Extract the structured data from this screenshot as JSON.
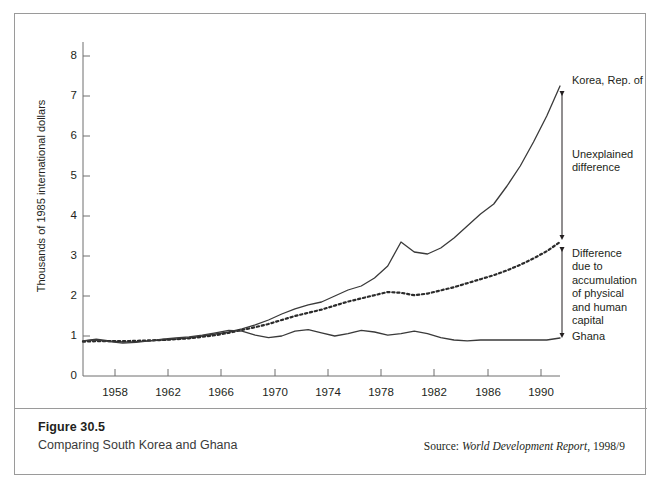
{
  "figure": {
    "number": "Figure 30.5",
    "caption": "Comparing South Korea and Ghana",
    "source_prefix": "Source: ",
    "source_italic": "World Development Report",
    "source_suffix": ", 1998/9"
  },
  "annotations": {
    "korea": "Korea, Rep. of",
    "unexplained": "Unexplained\ndifference",
    "accumulation": "Difference\ndue to\naccumulation\nof physical\nand human\ncapital",
    "ghana": "Ghana"
  },
  "colors": {
    "line": "#3a3a3a",
    "axis": "#6e6e6e",
    "border": "#9a9a9a",
    "text": "#231f20",
    "background": "#ffffff"
  },
  "chart_data": {
    "type": "line",
    "title": "Comparing South Korea and Ghana",
    "xlabel": "",
    "ylabel": "Thousands of 1985 international dollars",
    "xlim": [
      1954,
      1990
    ],
    "ylim": [
      0,
      8
    ],
    "ytick_labels": [
      "0",
      "1",
      "2",
      "3",
      "4",
      "5",
      "6",
      "7",
      "8"
    ],
    "yticks": [
      0,
      1,
      2,
      3,
      4,
      5,
      6,
      7,
      8
    ],
    "xtick_labels": [
      "1958",
      "1962",
      "1966",
      "1970",
      "1974",
      "1978",
      "1982",
      "1986",
      "1990"
    ],
    "xticks": [
      1958,
      1962,
      1966,
      1970,
      1974,
      1978,
      1982,
      1986,
      1990
    ],
    "grid": false,
    "legend": "annotated at right",
    "x": [
      1954,
      1955,
      1956,
      1957,
      1958,
      1959,
      1960,
      1961,
      1962,
      1963,
      1964,
      1965,
      1966,
      1967,
      1968,
      1969,
      1970,
      1971,
      1972,
      1973,
      1974,
      1975,
      1976,
      1977,
      1978,
      1979,
      1980,
      1981,
      1982,
      1983,
      1984,
      1985,
      1986,
      1987,
      1988,
      1989,
      1990
    ],
    "series": [
      {
        "name": "Korea, Rep. of",
        "style": "solid",
        "values": [
          0.88,
          0.92,
          0.88,
          0.85,
          0.86,
          0.88,
          0.9,
          0.92,
          0.95,
          1.0,
          1.05,
          1.1,
          1.18,
          1.28,
          1.4,
          1.55,
          1.68,
          1.78,
          1.85,
          2.0,
          2.15,
          2.25,
          2.45,
          2.75,
          3.35,
          3.1,
          3.05,
          3.2,
          3.45,
          3.75,
          4.05,
          4.3,
          4.75,
          5.25,
          5.85,
          6.5,
          7.25
        ]
      },
      {
        "name": "Difference due to accumulation of physical and human capital",
        "style": "dotted",
        "values": [
          0.86,
          0.87,
          0.87,
          0.87,
          0.88,
          0.89,
          0.9,
          0.92,
          0.94,
          0.98,
          1.02,
          1.08,
          1.15,
          1.22,
          1.3,
          1.4,
          1.5,
          1.58,
          1.66,
          1.76,
          1.86,
          1.94,
          2.02,
          2.1,
          2.08,
          2.02,
          2.06,
          2.14,
          2.22,
          2.32,
          2.42,
          2.52,
          2.64,
          2.78,
          2.94,
          3.12,
          3.35
        ]
      },
      {
        "name": "Ghana",
        "style": "solid",
        "values": [
          0.88,
          0.9,
          0.86,
          0.82,
          0.84,
          0.88,
          0.92,
          0.95,
          0.98,
          1.02,
          1.08,
          1.14,
          1.12,
          1.02,
          0.96,
          1.0,
          1.12,
          1.16,
          1.08,
          1.0,
          1.06,
          1.14,
          1.1,
          1.02,
          1.06,
          1.12,
          1.06,
          0.96,
          0.9,
          0.88,
          0.9,
          0.9,
          0.9,
          0.9,
          0.9,
          0.9,
          0.95
        ]
      }
    ]
  }
}
